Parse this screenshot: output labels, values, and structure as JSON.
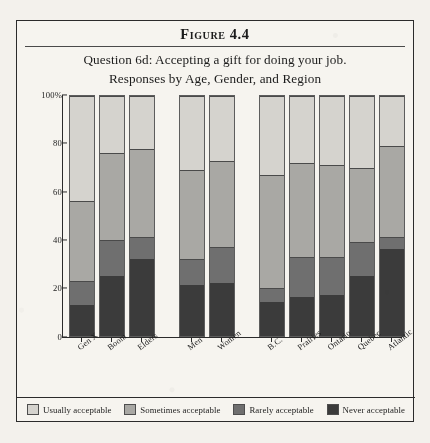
{
  "figure": {
    "label": "Figure 4.4",
    "subtitle_line1": "Question 6d: Accepting a gift for doing your job.",
    "subtitle_line2": "Responses by Age, Gender, and Region"
  },
  "axis": {
    "y_ticks": [
      "100%",
      "80",
      "60",
      "40",
      "20",
      "0"
    ]
  },
  "legend": {
    "items": [
      {
        "label": "Usually acceptable",
        "color": "#d5d3ce"
      },
      {
        "label": "Sometimes acceptable",
        "color": "#a9a8a4"
      },
      {
        "label": "Rarely acceptable",
        "color": "#6f6f6f"
      },
      {
        "label": "Never acceptable",
        "color": "#3b3b3b"
      }
    ]
  },
  "chart_data": {
    "type": "bar",
    "subtype": "stacked-bar-100",
    "title": "Question 6d: Accepting a gift for doing your job.",
    "subtitle": "Responses by Age, Gender, and Region",
    "xlabel": "",
    "ylabel": "",
    "ylim": [
      0,
      100
    ],
    "yticks": [
      0,
      20,
      40,
      60,
      80,
      100
    ],
    "grid": false,
    "legend_position": "bottom",
    "categories": [
      "Gen X",
      "Boom",
      "Elders",
      "Men",
      "Women",
      "B.C.",
      "Prairies",
      "Ontario",
      "Quebec",
      "Atlantic"
    ],
    "groups": [
      {
        "name": "Age",
        "categories": [
          "Gen X",
          "Boom",
          "Elders"
        ]
      },
      {
        "name": "Gender",
        "categories": [
          "Men",
          "Women"
        ]
      },
      {
        "name": "Region",
        "categories": [
          "B.C.",
          "Prairies",
          "Ontario",
          "Quebec",
          "Atlantic"
        ]
      }
    ],
    "series": [
      {
        "name": "Never acceptable",
        "color": "#3b3b3b",
        "values": [
          13,
          25,
          32,
          21,
          22,
          14,
          16,
          17,
          25,
          36
        ]
      },
      {
        "name": "Rarely acceptable",
        "color": "#6f6f6f",
        "values": [
          10,
          15,
          9,
          11,
          15,
          6,
          17,
          16,
          14,
          5
        ]
      },
      {
        "name": "Sometimes acceptable",
        "color": "#a9a8a4",
        "values": [
          33,
          36,
          37,
          37,
          36,
          47,
          39,
          38,
          31,
          38
        ]
      },
      {
        "name": "Usually acceptable",
        "color": "#d5d3ce",
        "values": [
          44,
          24,
          22,
          31,
          27,
          33,
          28,
          29,
          30,
          21
        ]
      }
    ]
  }
}
